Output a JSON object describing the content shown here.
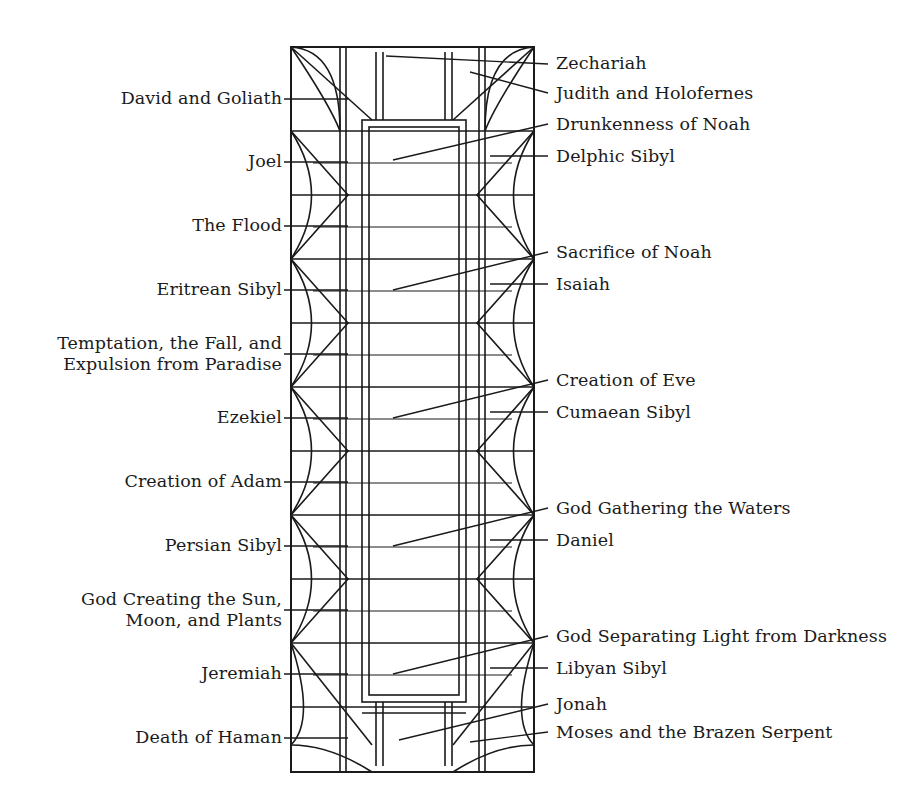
{
  "diagram": {
    "type": "architectural-plan-key",
    "stroke_color": "#1a1a1a",
    "background_color": "#ffffff",
    "frame": {
      "x": 291,
      "y": 47,
      "width": 243,
      "height": 725
    },
    "left_labels": [
      {
        "id": "david-and-goliath",
        "text": "David and Goliath",
        "x": 100,
        "y": 88,
        "leader_y": 99,
        "leader_x1": 288,
        "leader_x2": 340
      },
      {
        "id": "joel",
        "text": "Joel",
        "x": 234,
        "y": 151,
        "leader_y": 162,
        "leader_x1": 288,
        "leader_x2": 340
      },
      {
        "id": "the-flood",
        "text": "The Flood",
        "x": 182,
        "y": 215,
        "leader_y": 226,
        "leader_x1": 288,
        "leader_x2": 340
      },
      {
        "id": "eritrean-sibyl",
        "text": "Eritrean Sibyl",
        "x": 156,
        "y": 279,
        "leader_y": 290,
        "leader_x1": 288,
        "leader_x2": 340
      },
      {
        "id": "temptation-fall-expulsion",
        "text": "Temptation, the Fall, and\nExpulsion from Paradise",
        "x": 30,
        "y": 343,
        "leader_y": 354,
        "leader_x1": 288,
        "leader_x2": 340
      },
      {
        "id": "ezekiel",
        "text": "Ezekiel",
        "x": 205,
        "y": 407,
        "leader_y": 418,
        "leader_x1": 288,
        "leader_x2": 340
      },
      {
        "id": "creation-of-adam",
        "text": "Creation of Adam",
        "x": 109,
        "y": 471,
        "leader_y": 482,
        "leader_x1": 288,
        "leader_x2": 340
      },
      {
        "id": "persian-sibyl",
        "text": "Persian Sibyl",
        "x": 160,
        "y": 535,
        "leader_y": 546,
        "leader_x1": 288,
        "leader_x2": 340
      },
      {
        "id": "god-creating-sun-moon-plants",
        "text": "God Creating the Sun,\nMoon, and Plants",
        "x": 66,
        "y": 599,
        "leader_y": 610,
        "leader_x1": 288,
        "leader_x2": 340
      },
      {
        "id": "jeremiah",
        "text": "Jeremiah",
        "x": 190,
        "y": 663,
        "leader_y": 674,
        "leader_x1": 288,
        "leader_x2": 340
      },
      {
        "id": "death-of-haman",
        "text": "Death of Haman",
        "x": 123,
        "y": 727,
        "leader_y": 738,
        "leader_x1": 288,
        "leader_x2": 340
      }
    ],
    "right_labels": [
      {
        "id": "zechariah",
        "text": "Zechariah",
        "x": 556,
        "y": 59
      },
      {
        "id": "judith-and-holofernes",
        "text": "Judith and Holofernes",
        "x": 556,
        "y": 88
      },
      {
        "id": "drunkenness-of-noah",
        "text": "Drunkenness of Noah",
        "x": 556,
        "y": 119
      },
      {
        "id": "delphic-sibyl",
        "text": "Delphic Sibyl",
        "x": 556,
        "y": 151
      },
      {
        "id": "sacrifice-of-noah",
        "text": "Sacrifice of Noah",
        "x": 556,
        "y": 247
      },
      {
        "id": "isaiah",
        "text": "Isaiah",
        "x": 556,
        "y": 279
      },
      {
        "id": "creation-of-eve",
        "text": "Creation of Eve",
        "x": 556,
        "y": 375
      },
      {
        "id": "cumaean-sibyl",
        "text": "Cumaean Sibyl",
        "x": 556,
        "y": 407
      },
      {
        "id": "god-gathering-the-waters",
        "text": "God Gathering the Waters",
        "x": 556,
        "y": 503
      },
      {
        "id": "daniel",
        "text": "Daniel",
        "x": 556,
        "y": 535
      },
      {
        "id": "god-separating-light-from-darkness",
        "text": "God Separating Light from Darkness",
        "x": 556,
        "y": 631
      },
      {
        "id": "libyan-sibyl",
        "text": "Libyan Sibyl",
        "x": 556,
        "y": 663
      },
      {
        "id": "jonah",
        "text": "Jonah",
        "x": 556,
        "y": 699
      },
      {
        "id": "moses-and-the-brazen-serpent",
        "text": "Moses and the Brazen Serpent",
        "x": 556,
        "y": 727
      }
    ]
  }
}
